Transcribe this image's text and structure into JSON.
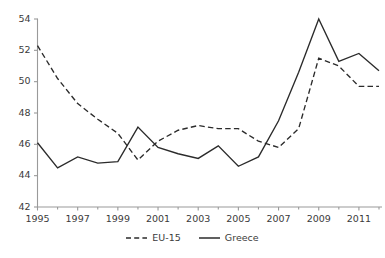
{
  "chart_data": {
    "type": "line",
    "title": "",
    "subtitle": "",
    "xlabel": "",
    "ylabel": "",
    "xlim": [
      1995,
      2012
    ],
    "ylim": [
      42,
      54
    ],
    "yticks": [
      42,
      44,
      46,
      48,
      50,
      52,
      54
    ],
    "ytick_labels": [
      "42",
      "44",
      "46",
      "48",
      "50",
      "52",
      "54"
    ],
    "xticks": [
      1995,
      1997,
      1999,
      2001,
      2003,
      2005,
      2007,
      2009,
      2011
    ],
    "xtick_labels": [
      "1995",
      "1997",
      "1999",
      "2001",
      "2003",
      "2005",
      "2007",
      "2009",
      "2011"
    ],
    "x": [
      1995,
      1996,
      1997,
      1998,
      1999,
      2000,
      2001,
      2002,
      2003,
      2004,
      2005,
      2006,
      2007,
      2008,
      2009,
      2010,
      2011,
      2012
    ],
    "grid": false,
    "legend_position": "bottom-center",
    "series": [
      {
        "name": "EU-15",
        "style": "dashed",
        "color": "#2b2b2b",
        "values": [
          52.3,
          50.2,
          48.6,
          47.6,
          46.7,
          45.0,
          46.2,
          46.9,
          47.2,
          47.0,
          47.0,
          46.2,
          45.8,
          47.0,
          51.5,
          51.0,
          49.7,
          49.7
        ]
      },
      {
        "name": "Greece",
        "style": "solid",
        "color": "#2b2b2b",
        "values": [
          46.1,
          44.5,
          45.2,
          44.8,
          44.9,
          47.1,
          45.8,
          45.4,
          45.1,
          45.9,
          44.6,
          45.2,
          47.5,
          50.6,
          54.0,
          51.3,
          51.8,
          50.7
        ]
      }
    ]
  },
  "legend": {
    "items": [
      {
        "label": "EU-15",
        "style": "dashed"
      },
      {
        "label": "Greece",
        "style": "solid"
      }
    ]
  },
  "axis_colors": {
    "axis_line": "#9a9a9a",
    "tick_text": "#3b3b3b",
    "series_line": "#2b2b2b"
  }
}
